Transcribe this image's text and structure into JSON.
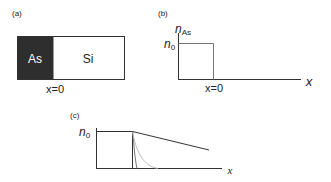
{
  "panels": {
    "a": {
      "label": "(a)",
      "left_material": "As",
      "right_material": "Si",
      "interface_label": "x=0"
    },
    "b": {
      "label": "(b)",
      "y_axis_label": "n",
      "y_axis_subscript": "As",
      "level_label": "n",
      "level_subscript": "0",
      "interface_label": "x=0",
      "x_axis_label": "x"
    },
    "c": {
      "label": "(c)",
      "level_label": "n",
      "level_subscript": "0",
      "x_axis_label": "x"
    }
  },
  "colors": {
    "as_fill": "#2e2e2e",
    "line": "#333333",
    "light_curve": "#b5b5b5",
    "mid_curve": "#666666"
  }
}
